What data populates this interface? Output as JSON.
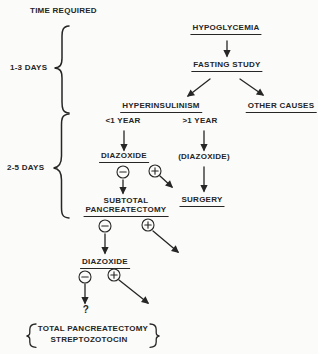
{
  "meta": {
    "ink_color": "#262626",
    "background_color": "#fbfbf9"
  },
  "timeline": {
    "header": "TIME REQUIRED",
    "phase1": "1-3 DAYS",
    "phase2": "2-5 DAYS"
  },
  "nodes": {
    "hypoglycemia": "HYPOGLYCEMIA",
    "fasting_study": "FASTING STUDY",
    "hyperinsulinism": "HYPERINSULINISM",
    "other_causes": "OTHER CAUSES",
    "under_one_year": "<1 YEAR",
    "over_one_year": ">1 YEAR",
    "diazoxide_trial": "DIAZOXIDE",
    "diazoxide_optional": "(DIAZOXIDE)",
    "subtotal_line1": "SUBTOTAL",
    "subtotal_line2": "PANCREATECTOMY",
    "surgery": "SURGERY",
    "diazoxide_retrial": "DIAZOXIDE",
    "question_mark": "?",
    "final_option1": "TOTAL PANCREATECTOMY",
    "final_option2": "STREPTOZOTOCIN"
  },
  "icons": {
    "minus_circle": "⊖",
    "plus_circle": "⊕"
  }
}
